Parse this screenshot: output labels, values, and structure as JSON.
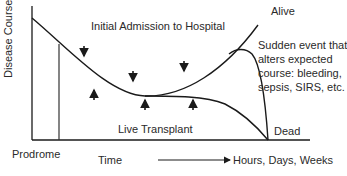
{
  "diagram": {
    "y_axis_label": "Disease Course",
    "x_axis_start_label": "Prodrome",
    "time_label": "Time",
    "time_range_label": "Hours, Days, Weeks",
    "top_label": "Initial Admission to Hospital",
    "outcome_alive": "Alive",
    "outcome_dead": "Dead",
    "transplant_label": "Live Transplant",
    "event_note_lines": [
      "Sudden event that",
      "alters expected",
      "course: bleeding,",
      "sepsis, SIRS, etc."
    ],
    "colors": {
      "line": "#1a1a1a",
      "text": "#2a2a2a",
      "background": "#ffffff"
    },
    "arrows": {
      "down": 3,
      "up": 3
    }
  }
}
